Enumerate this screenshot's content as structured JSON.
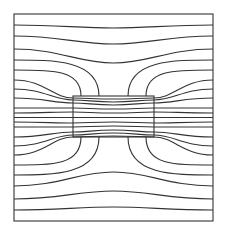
{
  "diagram": {
    "colors": {
      "line": "#333333",
      "background": "#ffffff"
    },
    "frame": {
      "x": 14,
      "y": 14,
      "width": 199,
      "height": 207
    },
    "block": {
      "x": 73,
      "y": 96,
      "width": 81,
      "height": 41
    },
    "center": {
      "x": 113.5,
      "y": 117.5
    },
    "pass_lines": [
      {
        "y_edge": 25,
        "y_mid": 28
      },
      {
        "y_edge": 36,
        "y_mid": 44
      },
      {
        "y_edge": 49,
        "y_mid": 63
      }
    ],
    "ending_lines": [
      {
        "y_edge": 60,
        "x_end": 99
      },
      {
        "y_edge": 70,
        "x_end": 81
      }
    ],
    "through_lines": [
      {
        "y_edge": 80,
        "y_enter": 98,
        "y_mid": 99
      },
      {
        "y_edge": 89,
        "y_enter": 100,
        "y_mid": 102
      },
      {
        "y_edge": 98,
        "y_enter": 103,
        "y_mid": 105
      },
      {
        "y_edge": 108,
        "y_enter": 108,
        "y_mid": 109
      },
      {
        "y_edge": 113,
        "y_enter": 112,
        "y_mid": 113
      },
      {
        "y_edge": 117.5,
        "y_enter": 117.5,
        "y_mid": 117.5
      }
    ]
  }
}
